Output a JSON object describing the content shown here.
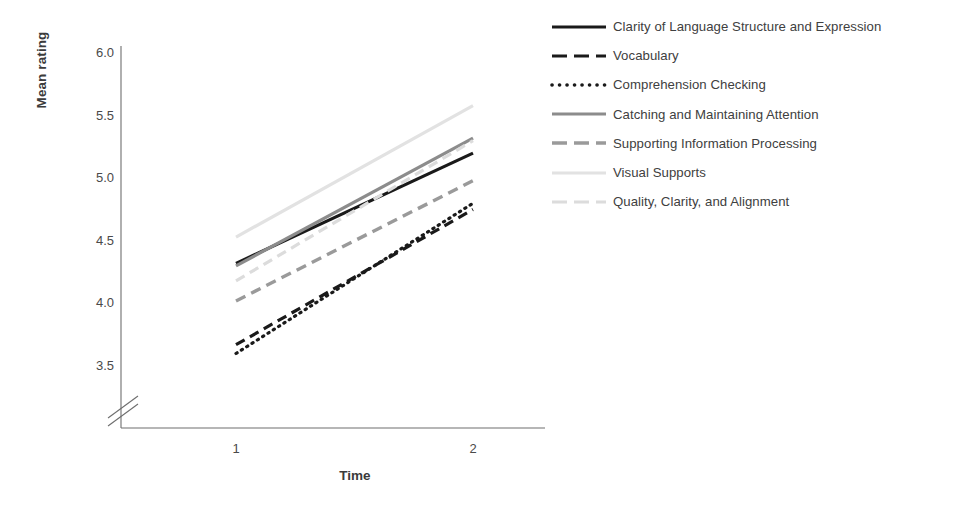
{
  "chart_data": {
    "type": "line",
    "title": "",
    "xlabel": "Time",
    "ylabel": "Mean rating",
    "x": [
      1,
      2
    ],
    "x_ticklabels": [
      "1",
      "2"
    ],
    "y_ticklabels": [
      "3.5",
      "4.0",
      "4.5",
      "5.0",
      "5.5",
      "6.0"
    ],
    "ylim": [
      3.5,
      6.0
    ],
    "y_axis_break": true,
    "grid": false,
    "legend_position": "right",
    "series": [
      {
        "name": "Clarity of Language Structure and Expression",
        "values": [
          4.32,
          5.2
        ],
        "color": "#1a1a1a",
        "style": "solid",
        "width": 3.2
      },
      {
        "name": "Vocabulary",
        "values": [
          3.67,
          4.75
        ],
        "color": "#1a1a1a",
        "style": "dashed",
        "width": 3.2
      },
      {
        "name": "Comprehension Checking",
        "values": [
          3.6,
          4.8
        ],
        "color": "#1a1a1a",
        "style": "dotted",
        "width": 3.2
      },
      {
        "name": "Catching and Maintaining Attention",
        "values": [
          4.3,
          5.32
        ],
        "color": "#8c8c8c",
        "style": "solid",
        "width": 3.2
      },
      {
        "name": "Supporting Information Processing",
        "values": [
          4.02,
          4.98
        ],
        "color": "#9a9a9a",
        "style": "dashed",
        "width": 3.4
      },
      {
        "name": "Visual Supports",
        "values": [
          4.53,
          5.58
        ],
        "color": "#e2e2e2",
        "style": "solid",
        "width": 3.2
      },
      {
        "name": "Quality, Clarity, and Alignment",
        "values": [
          4.18,
          5.3
        ],
        "color": "#dcdcdc",
        "style": "dashed",
        "width": 3.2
      }
    ]
  },
  "axes": {
    "y_title": "Mean rating",
    "x_title": "Time",
    "y_ticks": [
      "6.0",
      "5.5",
      "5.0",
      "4.5",
      "4.0",
      "3.5"
    ],
    "x_ticks": [
      "1",
      "2"
    ],
    "axis_color": "#6e6e6e"
  },
  "legend": {
    "items": [
      {
        "label": "Clarity of Language Structure and Expression",
        "color": "#1a1a1a",
        "style": "solid"
      },
      {
        "label": "Vocabulary",
        "color": "#1a1a1a",
        "style": "dashed"
      },
      {
        "label": "Comprehension Checking",
        "color": "#1a1a1a",
        "style": "dotted"
      },
      {
        "label": "Catching and Maintaining Attention",
        "color": "#8c8c8c",
        "style": "solid"
      },
      {
        "label": "Supporting Information Processing",
        "color": "#9a9a9a",
        "style": "dashed"
      },
      {
        "label": "Visual Supports",
        "color": "#e2e2e2",
        "style": "solid"
      },
      {
        "label": "Quality, Clarity, and Alignment",
        "color": "#dcdcdc",
        "style": "dashed"
      }
    ]
  }
}
